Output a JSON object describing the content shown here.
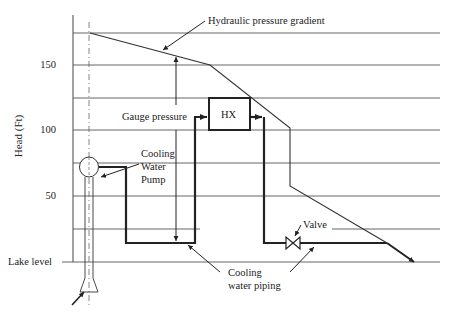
{
  "diagram": {
    "y_axis": {
      "label": "Head (Ft)",
      "ticks": [
        "150",
        "100",
        "50"
      ],
      "baseline_label": "Lake level"
    },
    "labels": {
      "hgl": "Hydraulic pressure gradient",
      "gauge": "Gauge pressure",
      "hx": "HX",
      "pump_line1": "Cooling",
      "pump_line2": "Water",
      "pump_line3": "Pump",
      "valve": "Valve",
      "piping_line1": "Cooling",
      "piping_line2": "water piping"
    },
    "colors": {
      "line": "#2a2a2a",
      "grid": "#555555",
      "background": "#ffffff"
    }
  }
}
